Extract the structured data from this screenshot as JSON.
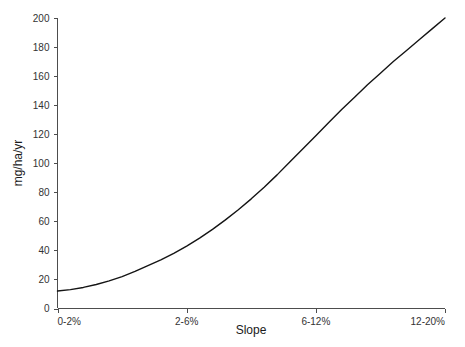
{
  "chart_data": {
    "type": "line",
    "title": "",
    "xlabel": "Slope",
    "ylabel": "mg/ha/yr",
    "categories": [
      "0-2%",
      "2-6%",
      "6-12%",
      "12-20%"
    ],
    "x": [
      0,
      1,
      2,
      3
    ],
    "series": [
      {
        "name": "erosion-rate",
        "values": [
          12,
          43,
          119,
          200
        ]
      }
    ],
    "dense_x": [
      0,
      0.1,
      0.2,
      0.3,
      0.4,
      0.5,
      0.6,
      0.7,
      0.8,
      0.9,
      1.0,
      1.1,
      1.2,
      1.3,
      1.4,
      1.5,
      1.6,
      1.7,
      1.8,
      1.9,
      2.0,
      2.1,
      2.2,
      2.3,
      2.4,
      2.5,
      2.6,
      2.7,
      2.8,
      2.9,
      3.0
    ],
    "dense_y": [
      12,
      13,
      14.5,
      16.5,
      19,
      22,
      25.5,
      29.5,
      33.5,
      38,
      43,
      48.5,
      54.5,
      61,
      68,
      75.5,
      83.5,
      92,
      101,
      110,
      119,
      128,
      137,
      145.5,
      154,
      162,
      170,
      177.5,
      185,
      192.5,
      200
    ],
    "ylim": [
      0,
      200
    ],
    "xlim": [
      0,
      3
    ],
    "y_ticks": [
      0,
      20,
      40,
      60,
      80,
      100,
      120,
      140,
      160,
      180,
      200
    ],
    "y_tick_labels": [
      "0",
      "20",
      "40",
      "60",
      "80",
      "100",
      "120",
      "140",
      "160",
      "180",
      "200"
    ],
    "x_tick_labels": [
      "0-2%",
      "2-6%",
      "6-12%",
      "12-20%"
    ],
    "grid": false,
    "legend": false,
    "line_color": "#141414",
    "axis_color": "#4d4d4d",
    "background_color": "#ffffff"
  }
}
